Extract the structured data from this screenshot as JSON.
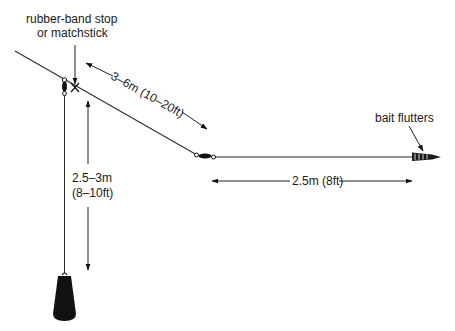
{
  "diagram": {
    "type": "fishing-rig",
    "colors": {
      "line": "#2a2a2a",
      "ink": "#111111",
      "background": "#ffffff"
    },
    "labels": {
      "stop_line1": "rubber-band stop",
      "stop_line2": "or matchstick",
      "main_line_length": "3–6m (10–20ft)",
      "drop_length_line1": "2.5–3m",
      "drop_length_line2": "(8–10ft)",
      "leader_length": "2.5m (8ft)",
      "bait": "bait flutters"
    },
    "components": [
      {
        "name": "main-line",
        "label": "main line"
      },
      {
        "name": "rubber-band-stop",
        "label": "rubber-band stop or matchstick"
      },
      {
        "name": "sliding-swivel",
        "label": "swivel"
      },
      {
        "name": "sinker-drop-line",
        "label": "sinker drop line"
      },
      {
        "name": "sinker",
        "label": "sinker"
      },
      {
        "name": "lower-swivel",
        "label": "swivel"
      },
      {
        "name": "leader",
        "label": "leader"
      },
      {
        "name": "bait",
        "label": "bait"
      }
    ],
    "dimensions": [
      {
        "name": "main-line-length",
        "value": "3–6m (10–20ft)"
      },
      {
        "name": "drop-length",
        "value": "2.5–3m (8–10ft)"
      },
      {
        "name": "leader-length",
        "value": "2.5m (8ft)"
      }
    ]
  }
}
